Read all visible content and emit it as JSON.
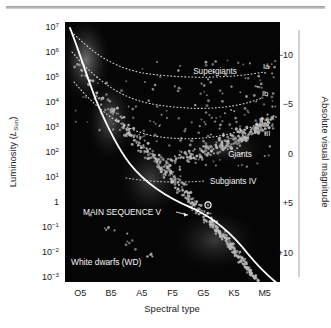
{
  "figure": {
    "background": "#ffffff",
    "plot_background": "#050505",
    "rule_color": "#a8a8a8",
    "star_color": "#b9b9b9",
    "curve_color": "#ffffff",
    "dotted_color": "#d8d8d8"
  },
  "chart_data": {
    "type": "scatter",
    "title": "",
    "xlabel": "Spectral type",
    "ylabel": "Luminosity (L_Sun)",
    "ylabel_main": "Luminosity (",
    "ylabel_sub": "L",
    "ylabel_subsub": "Sun",
    "ylabel_end": ")",
    "y2label": "Absolute visual magnitude",
    "grid": false,
    "legend": "none",
    "x_ticks": [
      "O5",
      "B5",
      "A5",
      "F5",
      "G5",
      "K5",
      "M5"
    ],
    "x_tick_positions": [
      0.5,
      1.5,
      2.5,
      3.5,
      4.5,
      5.5,
      6.5
    ],
    "y_ticks": [
      {
        "mantissa": "10",
        "exponent": "7",
        "value": 7
      },
      {
        "mantissa": "10",
        "exponent": "6",
        "value": 6
      },
      {
        "mantissa": "10",
        "exponent": "5",
        "value": 5
      },
      {
        "mantissa": "10",
        "exponent": "4",
        "value": 4
      },
      {
        "mantissa": "10",
        "exponent": "3",
        "value": 3
      },
      {
        "mantissa": "10",
        "exponent": "2",
        "value": 2
      },
      {
        "mantissa": "10",
        "exponent": "1",
        "value": 1
      },
      {
        "mantissa": "1",
        "exponent": "",
        "value": 0
      },
      {
        "mantissa": "10",
        "exponent": "−1",
        "value": -1
      },
      {
        "mantissa": "10",
        "exponent": "−2",
        "value": -2
      },
      {
        "mantissa": "10",
        "exponent": "−3",
        "value": -3
      }
    ],
    "ylim_log10": [
      -3,
      7
    ],
    "y2_ticks": [
      "−10",
      "−5",
      "0",
      "+5",
      "+10"
    ],
    "y2lim": [
      -12.5,
      12.5
    ],
    "annotations": [
      {
        "id": "supergiants",
        "text": "Supergiants",
        "x": 4.55,
        "y_log": 4.62
      },
      {
        "id": "class-ia",
        "text": "Ia",
        "x": 6.42,
        "y_log": 4.92
      },
      {
        "id": "class-ib",
        "text": "Ib",
        "x": 6.4,
        "y_log": 3.92
      },
      {
        "id": "class-ii",
        "text": "II",
        "x": 6.38,
        "y_log": 2.92
      },
      {
        "id": "class-iii",
        "text": "III",
        "x": 6.55,
        "y_log": 2.44
      },
      {
        "id": "giants",
        "text": "Giants",
        "x": 5.85,
        "y_log": 1.92
      },
      {
        "id": "subgiants",
        "text": "Subgiants IV",
        "x": 5.55,
        "y_log": 0.92
      },
      {
        "id": "main-sequence",
        "text": "MAIN SEQUENCE V",
        "x": 1.95,
        "y_log": -0.3
      },
      {
        "id": "white-dwarfs",
        "text": "White dwarfs (WD)",
        "x": 0.95,
        "y_log": -2.45
      }
    ],
    "luminosity_classes": [
      {
        "name": "Ia",
        "label": "Ia"
      },
      {
        "name": "Ib",
        "label": "Ib"
      },
      {
        "name": "II",
        "label": "II"
      },
      {
        "name": "III",
        "label": "III"
      },
      {
        "name": "IV",
        "label": "Subgiants IV"
      },
      {
        "name": "V",
        "label": "MAIN SEQUENCE V"
      },
      {
        "name": "WD",
        "label": "White dwarfs (WD)"
      }
    ],
    "sun_marker": {
      "label": "Sun",
      "x": 4.48,
      "y_log": 0.0
    },
    "series": [
      {
        "name": "main-sequence",
        "description": "Main sequence stars, dense band from O to M",
        "point_count": 520
      },
      {
        "name": "giant-branch",
        "description": "Giant branch clump, spectral types F5-M5",
        "point_count": 240
      },
      {
        "name": "supergiants",
        "description": "Sparse supergiant scatter above 10^3 L_Sun",
        "point_count": 95
      },
      {
        "name": "white-dwarfs",
        "description": "Sparse white dwarf band below 10^-1 L_Sun",
        "point_count": 18
      }
    ]
  }
}
